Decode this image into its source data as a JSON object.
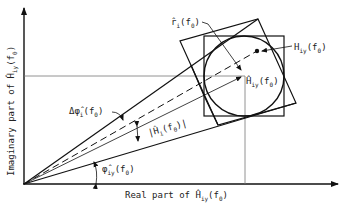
{
  "diagram": {
    "x_axis_label": {
      "prefix": "Real part of ",
      "symbol": "Ĥ",
      "sub": "iy",
      "arg": "(f",
      "arg_sub": "0",
      "close": ")"
    },
    "y_axis_label": {
      "prefix": "Imaginary part of ",
      "symbol": "Ĥ",
      "sub": "iy",
      "arg": "(f",
      "arg_sub": "0",
      "close": ")"
    },
    "labels": {
      "r_hat": {
        "symbol": "r̂",
        "sub": "i",
        "arg": "(f",
        "arg_sub": "0",
        "close": ")"
      },
      "H_true": {
        "symbol": "H",
        "sub": "iy",
        "arg": "(f",
        "arg_sub": "0",
        "close": ")"
      },
      "H_hat": {
        "symbol": "Ĥ",
        "sub": "iy",
        "arg": "(f",
        "arg_sub": "0",
        "close": ")"
      },
      "delta_phi": {
        "symbol": "Δφ̂",
        "sub": "i",
        "arg": "(f",
        "arg_sub": "0",
        "close": ")"
      },
      "magnitude": {
        "open": "|",
        "symbol": "Ĥ",
        "sub": "i",
        "arg": "(f",
        "arg_sub": "0",
        "close": ")|"
      },
      "phi_hat": {
        "symbol": "φ̂",
        "sub": "iy",
        "arg": "(f",
        "arg_sub": "0",
        "close": ")"
      }
    },
    "colors": {
      "line": "#111111",
      "guide": "#777777"
    }
  }
}
